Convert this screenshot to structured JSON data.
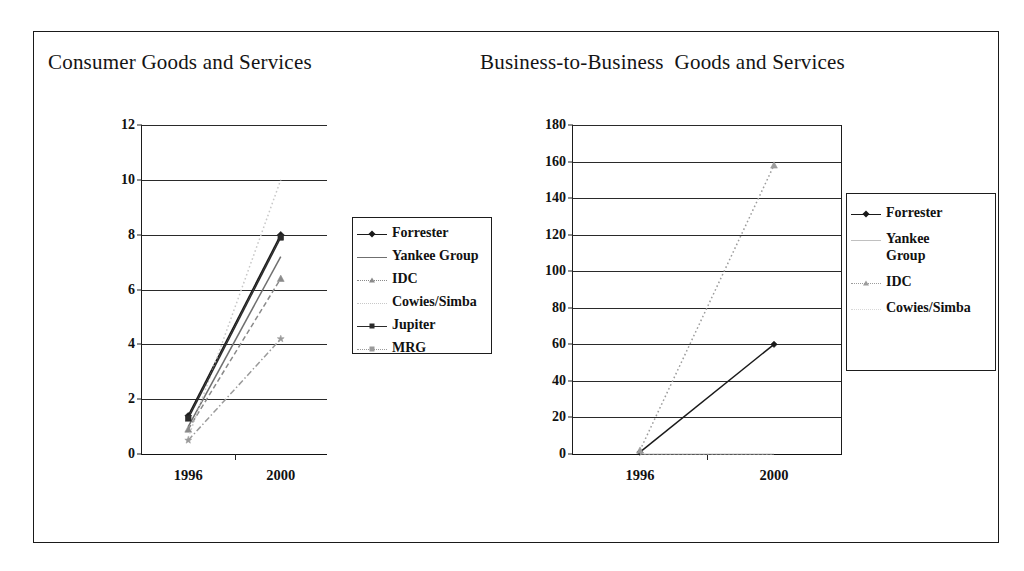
{
  "figure": {
    "background": "#ffffff",
    "border_color": "#1a1a1a"
  },
  "panels": {
    "consumer": {
      "title": "Consumer Goods and Services"
    },
    "b2b": {
      "title": "Business-to-Business  Goods and Services"
    }
  },
  "chart_data": [
    {
      "type": "line",
      "title": "Consumer Goods and Services",
      "xlabel": "",
      "ylabel": "",
      "x": [
        "1996",
        "2000"
      ],
      "categories": [
        "1996",
        "2000"
      ],
      "ylim": [
        0,
        12
      ],
      "yticks": [
        0,
        2,
        4,
        6,
        8,
        10,
        12
      ],
      "ytick_labels": [
        "0",
        "2",
        "4",
        "6",
        "8",
        "10",
        "12"
      ],
      "xtick_labels": [
        "1996",
        "2000"
      ],
      "grid": true,
      "legend_position": "right",
      "series": [
        {
          "name": "Forrester",
          "values": [
            1.4,
            8.0
          ],
          "color": "#1a1a1a",
          "marker": "diamond",
          "dash": "none"
        },
        {
          "name": "Yankee Group",
          "values": [
            1.0,
            7.2
          ],
          "color": "#6f6f6f",
          "marker": "none",
          "dash": "none"
        },
        {
          "name": "IDC",
          "values": [
            0.9,
            6.4
          ],
          "color": "#8a8a8a",
          "marker": "triangle",
          "dash": "dash"
        },
        {
          "name": "Cowies/Simba",
          "values": [
            0.6,
            10.0
          ],
          "color": "#c8c8c8",
          "marker": "none",
          "dash": "dot"
        },
        {
          "name": "Jupiter",
          "values": [
            1.3,
            7.9
          ],
          "color": "#2b2b2b",
          "marker": "square",
          "dash": "none"
        },
        {
          "name": "MRG",
          "values": [
            0.5,
            4.2
          ],
          "color": "#9a9a9a",
          "marker": "star",
          "dash": "dashdot"
        }
      ]
    },
    {
      "type": "line",
      "title": "Business-to-Business  Goods and Services",
      "xlabel": "",
      "ylabel": "",
      "x": [
        "1996",
        "2000"
      ],
      "categories": [
        "1996",
        "2000"
      ],
      "ylim": [
        0,
        180
      ],
      "yticks": [
        0,
        20,
        40,
        60,
        80,
        100,
        120,
        140,
        160,
        180
      ],
      "ytick_labels": [
        "0",
        "20",
        "40",
        "60",
        "80",
        "100",
        "120",
        "140",
        "160",
        "180"
      ],
      "xtick_labels": [
        "1996",
        "2000"
      ],
      "grid": true,
      "legend_position": "right",
      "series": [
        {
          "name": "Forrester",
          "values": [
            1,
            60
          ],
          "color": "#1a1a1a",
          "marker": "diamond",
          "dash": "none"
        },
        {
          "name": "Yankee Group",
          "values": [
            0,
            0
          ],
          "color": "#c0c0c0",
          "marker": "none",
          "dash": "none"
        },
        {
          "name": "IDC",
          "values": [
            2,
            158
          ],
          "color": "#9c9c9c",
          "marker": "triangle",
          "dash": "dot"
        },
        {
          "name": "Cowies/Simba",
          "values": [
            0,
            0
          ],
          "color": "#d8d8d8",
          "marker": "none",
          "dash": "dot"
        }
      ]
    }
  ],
  "legends": {
    "consumer": [
      {
        "label": "Forrester"
      },
      {
        "label": "Yankee Group"
      },
      {
        "label": "IDC"
      },
      {
        "label": "Cowies/Simba"
      },
      {
        "label": "Jupiter"
      },
      {
        "label": "MRG"
      }
    ],
    "b2b": [
      {
        "label": "Forrester"
      },
      {
        "label": "Yankee\nGroup"
      },
      {
        "label": "IDC"
      },
      {
        "label": "Cowies/Simba"
      }
    ]
  }
}
